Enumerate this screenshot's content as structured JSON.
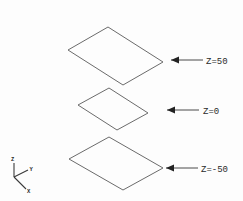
{
  "figure": {
    "background_color": "#fdfdfd",
    "line_color": "#6b6b6b",
    "arrow_color": "#222222",
    "text_color": "#2a2a2a",
    "width": 243,
    "height": 201
  },
  "planes": [
    {
      "id": "plane-z50",
      "label": "Z=50",
      "z_value": 50,
      "points": "108,27 163,62 123,85 68,50"
    },
    {
      "id": "plane-z0",
      "label": "Z=0",
      "z_value": 0,
      "points": "109,88 148,113 117,130 78,105"
    },
    {
      "id": "plane-zminus50",
      "label": "Z=-50",
      "z_value": -50,
      "points": "109,137 163,168 123,190 69,159"
    }
  ],
  "callouts": [
    {
      "id": "callout-z50",
      "label": "Z=50",
      "arrow_tip_x": 171,
      "arrow_tail_x": 203,
      "y": 60,
      "text_x": 206
    },
    {
      "id": "callout-z0",
      "label": "Z=0",
      "arrow_tip_x": 167,
      "arrow_tail_x": 199,
      "y": 110,
      "text_x": 203
    },
    {
      "id": "callout-zminus50",
      "label": "Z=-50",
      "arrow_tip_x": 166,
      "arrow_tail_x": 198,
      "y": 168,
      "text_x": 201
    }
  ],
  "axis_triad": {
    "origin_x": 14,
    "origin_y": 177,
    "axes": [
      {
        "id": "axis-z",
        "label": "Z",
        "end_x": 14,
        "end_y": 162,
        "label_x": 11,
        "label_y": 160
      },
      {
        "id": "axis-y",
        "label": "Y",
        "end_x": 29,
        "end_y": 170,
        "label_x": 30,
        "label_y": 170
      },
      {
        "id": "axis-x",
        "label": "X",
        "end_x": 27,
        "end_y": 190,
        "label_x": 28,
        "label_y": 192
      }
    ]
  }
}
